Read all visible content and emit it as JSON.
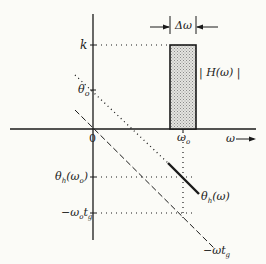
{
  "diagram": {
    "title": "",
    "axes": {
      "horizontal_label": "ω",
      "origin_label": "0"
    },
    "vertical_ticks": [
      {
        "name": "k",
        "label": "k"
      },
      {
        "name": "theta-o",
        "label": "θo"
      },
      {
        "name": "theta-h-omega-o",
        "label": "θh(ωo)"
      },
      {
        "name": "neg-omega-o-tg",
        "label": "−ωotg"
      }
    ],
    "horizontal_ticks": [
      {
        "name": "omega-o",
        "label": "ωo"
      }
    ],
    "bandwidth_label": "Δω",
    "magnitude_label": "| H(ω) |",
    "phase_label": "θh(ω)",
    "linear_phase_label": "−ωtg",
    "colors": {
      "ink": "#1a1a1a",
      "fill": "#cfcfcf",
      "background": "#fbfbf7"
    }
  }
}
